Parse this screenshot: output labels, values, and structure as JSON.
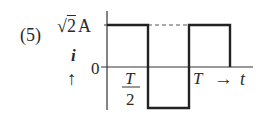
{
  "problem_number": "(5)",
  "amplitude_label": "√2 A",
  "amplitude_sqrt": "√",
  "amplitude_value": "2",
  "amplitude_unit": "A",
  "zero_label": "0",
  "y_axis_label": "i",
  "y_axis_arrow": "↑",
  "half_period_numerator": "T",
  "half_period_denominator": "2",
  "period_label": "T",
  "x_axis_arrow": "→",
  "x_axis_label": "t",
  "waveform": {
    "type": "square",
    "segments": [
      {
        "t_start": "0",
        "t_end": "T/2",
        "i": "√2 A"
      },
      {
        "t_start": "T/2",
        "t_end": "T",
        "i": "-√2 A"
      },
      {
        "t_start": "T",
        "t_end": "3T/2",
        "i": "√2 A"
      }
    ],
    "dashed_reference": "√2 A level between T/2 and T"
  }
}
